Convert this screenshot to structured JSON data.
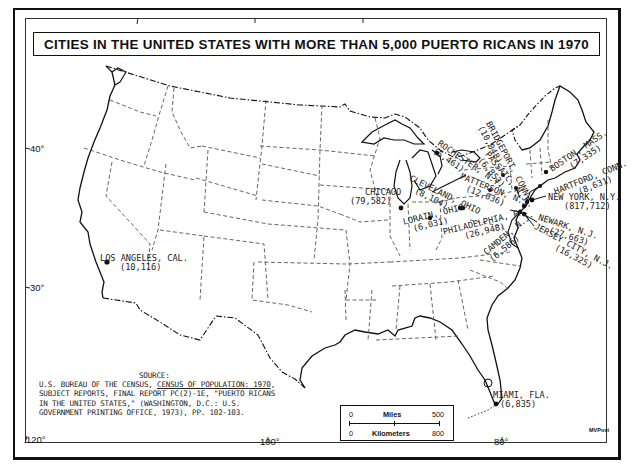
{
  "title": "CITIES IN THE UNITED STATES WITH MORE THAN 5,000 PUERTO RICANS IN 1970",
  "cities": [
    {
      "name": "LOS ANGELES, CAL.",
      "value": "(10,116)"
    },
    {
      "name": "CHICAGO",
      "value": "(79,582)"
    },
    {
      "name": "ROCHESTER, N.Y.",
      "value": "(5,461)"
    },
    {
      "name": "CLEVELAND, OHIO",
      "value": "(8,104)"
    },
    {
      "name": "LORAIN, OHIO",
      "value": "(6,031)"
    },
    {
      "name": "BRIDGEPORT, CONN.",
      "value": "(10,048)"
    },
    {
      "name": "PASSAIC, N.J.",
      "value": "(6,853)"
    },
    {
      "name": "PATTERSON, N.J.",
      "value": "(12,036)"
    },
    {
      "name": "BOSTON, MASS.",
      "value": "(7,335)"
    },
    {
      "name": "HARTFORD, CONN.",
      "value": "(8,631)"
    },
    {
      "name": "NEW YORK, N.Y.",
      "value": "(817,712)"
    },
    {
      "name": "NEWARK, N.J.",
      "value": "(27,663)"
    },
    {
      "name": "JERSEY CITY, N.J.",
      "value": "(16,325)"
    },
    {
      "name": "PHILADELPHIA, PA.",
      "value": "(26,948)"
    },
    {
      "name": "CAMDEN, N.J.",
      "value": "(6,586)"
    },
    {
      "name": "MIAMI, FLA.",
      "value": "(6,835)"
    }
  ],
  "latitude_ticks": [
    "40°",
    "30°"
  ],
  "longitude_ticks": [
    "120°",
    "100°",
    "80°"
  ],
  "source": {
    "header": "SOURCE:",
    "line1_a": "U.S. BUREAU OF THE CENSUS, ",
    "line1_b": "CENSUS OF POPULATION: 1970",
    "line1_c": ",",
    "line2": "SUBJECT REPORTS, FINAL REPORT PC(2)-1E, \"PUERTO RICANS",
    "line3": "IN THE UNITED STATES,\"  (WASHINGTON, D.C.:  U.S.",
    "line4": "GOVERNMENT PRINTING OFFICE, 1973), PP. 102-103."
  },
  "scale": {
    "miles_label": "Miles",
    "km_label": "Kilometers",
    "miles_min": "0",
    "miles_max": "500",
    "km_min": "0",
    "km_max": "800"
  },
  "credit": "MVPost"
}
